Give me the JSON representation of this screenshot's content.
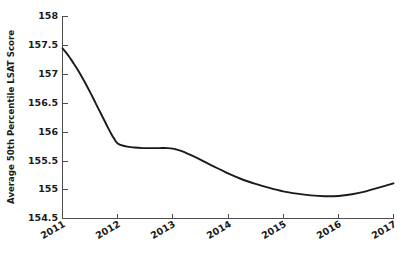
{
  "chart_data": {
    "type": "line",
    "title": "",
    "xlabel": "",
    "ylabel": "Average 50th Percentile LSAT Score",
    "x": [
      2011,
      2012,
      2013,
      2014,
      2015,
      2016,
      2017
    ],
    "xtick_labels": [
      "2011",
      "2012",
      "2013",
      "2014",
      "2015",
      "2016",
      "2017"
    ],
    "ytick_labels": [
      "154.5",
      "155",
      "155.5",
      "156",
      "156.5",
      "157",
      "157.5",
      "158"
    ],
    "ytick_values": [
      154.5,
      155,
      155.5,
      156,
      156.5,
      157,
      157.5,
      158
    ],
    "xlim": [
      2011,
      2017
    ],
    "ylim": [
      154.5,
      158
    ],
    "grid": false,
    "legend": false,
    "series": [
      {
        "name": "Average 50th Percentile LSAT Score",
        "color": "#1a1a1a",
        "values": [
          157.45,
          155.8,
          155.72,
          155.28,
          154.97,
          154.9,
          155.11
        ],
        "dense_x": [
          2011.0,
          2011.1,
          2011.2,
          2011.3,
          2011.4,
          2011.5,
          2011.6,
          2011.7,
          2011.8,
          2011.9,
          2012.0,
          2012.15,
          2012.3,
          2012.45,
          2012.6,
          2012.75,
          2012.9,
          2013.0,
          2013.15,
          2013.3,
          2013.5,
          2013.7,
          2013.9,
          2014.0,
          2014.25,
          2014.5,
          2014.75,
          2015.0,
          2015.25,
          2015.5,
          2015.75,
          2016.0,
          2016.25,
          2016.5,
          2016.75,
          2017.0
        ],
        "dense_y": [
          157.45,
          157.33,
          157.19,
          157.04,
          156.87,
          156.69,
          156.5,
          156.31,
          156.12,
          155.94,
          155.8,
          155.75,
          155.73,
          155.72,
          155.72,
          155.72,
          155.72,
          155.71,
          155.67,
          155.61,
          155.52,
          155.42,
          155.33,
          155.28,
          155.18,
          155.1,
          155.03,
          154.97,
          154.93,
          154.9,
          154.885,
          154.89,
          154.92,
          154.97,
          155.04,
          155.11
        ]
      }
    ]
  },
  "axes": {
    "y_axis_name": "y-axis",
    "x_axis_name": "x-axis"
  }
}
